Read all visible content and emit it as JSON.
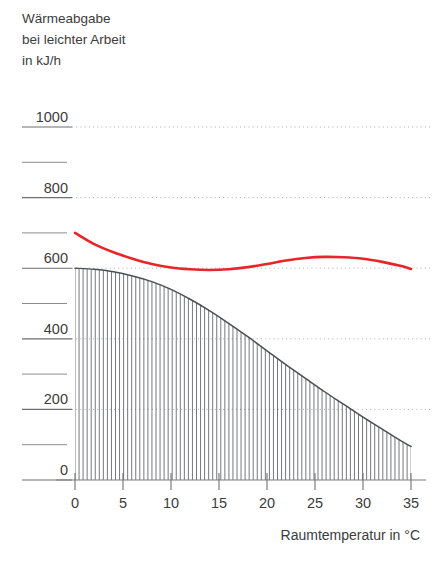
{
  "title": {
    "line1": "Wärmeabgabe",
    "line2": "bei leichter Arbeit",
    "line3": "in kJ/h"
  },
  "axes": {
    "xlabel": "Raumtemperatur in  °C",
    "ylabel_inline": "in kJ/h"
  },
  "chart_data": {
    "type": "line",
    "title": "Wärmeabgabe bei leichter Arbeit in kJ/h",
    "xlabel": "Raumtemperatur in  °C",
    "ylabel": "Wärmeabgabe bei leichter Arbeit in kJ/h",
    "xlim": [
      0,
      35
    ],
    "ylim": [
      0,
      1000
    ],
    "xticks": [
      0,
      5,
      10,
      15,
      20,
      25,
      30,
      35
    ],
    "xtick_labels": [
      "0",
      "5",
      "10",
      "15",
      "20",
      "25",
      "30",
      "35"
    ],
    "yticks": [
      0,
      200,
      400,
      600,
      800,
      1000
    ],
    "ytick_labels": [
      "0",
      "200",
      "400",
      "600",
      "800",
      "1000"
    ],
    "yticks_minor": [
      100,
      300,
      500,
      700,
      900
    ],
    "grid": "horizontal-dotted",
    "legend": "none",
    "series": [
      {
        "name": "Gesamtwärmeabgabe",
        "color": "#e8262a",
        "style": "solid-thick",
        "x": [
          0,
          2,
          4,
          6,
          8,
          10,
          12,
          14,
          16,
          18,
          20,
          22,
          24,
          26,
          28,
          30,
          32,
          34,
          35
        ],
        "values": [
          700,
          668,
          645,
          627,
          612,
          602,
          597,
          595,
          597,
          603,
          612,
          622,
          629,
          632,
          631,
          627,
          618,
          606,
          598
        ]
      },
      {
        "name": "Trockene Wärmeabgabe (Strahlung und Konvektion)",
        "color": "#4c5056",
        "style": "solid-thin-hatched-area",
        "x": [
          0,
          2,
          4,
          6,
          8,
          10,
          12,
          14,
          16,
          18,
          20,
          22,
          24,
          26,
          28,
          30,
          32,
          34,
          35
        ],
        "values": [
          600,
          597,
          590,
          578,
          562,
          540,
          512,
          480,
          444,
          406,
          366,
          326,
          288,
          250,
          214,
          178,
          144,
          110,
          95
        ]
      }
    ],
    "annotations": []
  }
}
